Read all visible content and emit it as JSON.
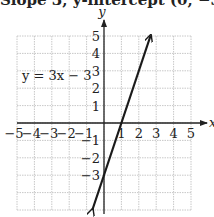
{
  "header": {
    "cutoff_text": "Slope 3, y-intercept (0, −3)"
  },
  "chart_data": {
    "type": "line",
    "title": "",
    "equation_label": "y = 3x − 3",
    "xlabel": "x",
    "ylabel": "y",
    "xlim": [
      -5,
      5
    ],
    "ylim": [
      -5,
      5
    ],
    "grid": true,
    "x_tick_labels": [
      "−5",
      "−4",
      "−3",
      "−2",
      "−1",
      "1",
      "2",
      "3",
      "4",
      "5"
    ],
    "y_tick_labels": [
      "5",
      "4",
      "3",
      "2",
      "1",
      "−1",
      "−2",
      "−3"
    ],
    "series": [
      {
        "name": "y = 3x − 3",
        "slope": 3,
        "intercept": -3,
        "x": [
          -0.67,
          2.67
        ],
        "y": [
          -5,
          5
        ],
        "arrows": "both"
      }
    ],
    "key_points": [
      {
        "label": "y-intercept",
        "x": 0,
        "y": -3
      },
      {
        "label": "x-intercept",
        "x": 1,
        "y": 0
      }
    ]
  },
  "colors": {
    "line": "#1a1a1a",
    "grid": "#c8c8c8",
    "axis": "#222222",
    "text": "#222222"
  }
}
